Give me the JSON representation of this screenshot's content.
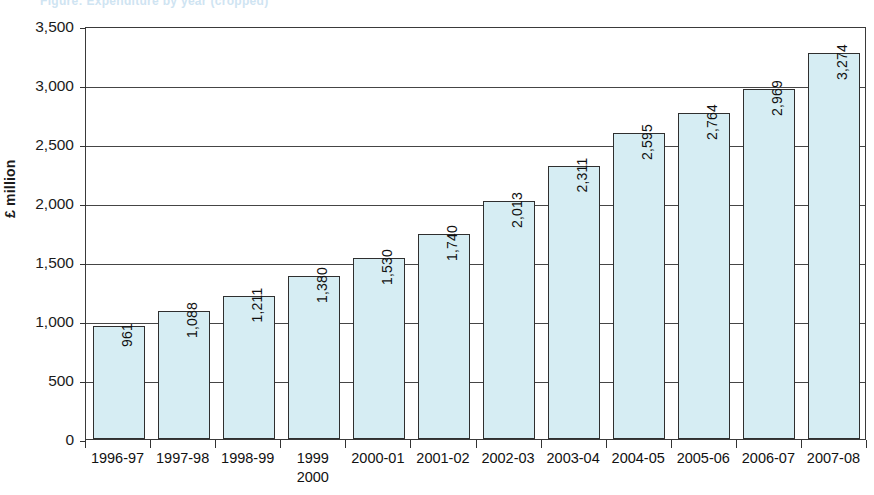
{
  "header": {
    "cropped_title_ghost": "Figure: Expenditure by year (cropped)"
  },
  "chart_data": {
    "type": "bar",
    "title": "",
    "subtitle": "",
    "xlabel": "",
    "ylabel": "£ million",
    "categories": [
      "1996-97",
      "1997-98",
      "1998-99",
      "1999\n2000",
      "2000-01",
      "2001-02",
      "2002-03",
      "2003-04",
      "2004-05",
      "2005-06",
      "2006-07",
      "2007-08"
    ],
    "values": [
      961,
      1088,
      1211,
      1380,
      1530,
      1740,
      2013,
      2311,
      2595,
      2764,
      2969,
      3274
    ],
    "data_labels": [
      "961",
      "1,088",
      "1,211",
      "1,380",
      "1,530",
      "1,740",
      "2,013",
      "2,311",
      "2,595",
      "2,764",
      "2,969",
      "3,274"
    ],
    "ylim": [
      0,
      3500
    ],
    "yticks": [
      0,
      500,
      1000,
      1500,
      2000,
      2500,
      3000,
      3500
    ],
    "ytick_labels": [
      "0",
      "500",
      "1,000",
      "1,500",
      "2,000",
      "2,500",
      "3,000",
      "3,500"
    ],
    "grid": true,
    "grid_axis": "y",
    "legend": "none",
    "bar_fill_color": "#d6edf3",
    "bar_border_color": "#2f2f2f",
    "axis_color": "#3a3a3a",
    "text_color": "#111111",
    "data_label_rotation": -90,
    "ylabel_rotation": -90
  }
}
